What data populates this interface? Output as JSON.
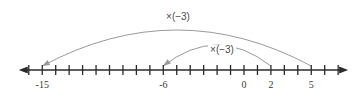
{
  "figure": {
    "background_color": "#ffffff",
    "axis_color": "#2b2b2b",
    "arc_color": "#9a9a9a",
    "label_color": "#3a3a3a"
  },
  "number_line": {
    "min": -16,
    "max": 7,
    "origin_x": 244,
    "unit_px": 13.45,
    "baseline_y": 70,
    "tick_half_height": 5,
    "left_arrow": true,
    "right_arrow": true,
    "tick_values": [
      -16,
      -15,
      -14,
      -13,
      -12,
      -11,
      -10,
      -9,
      -8,
      -7,
      -6,
      -5,
      -4,
      -3,
      -2,
      -1,
      0,
      1,
      2,
      3,
      4,
      5,
      6,
      7
    ],
    "labeled_ticks": [
      {
        "value": -15,
        "label": "-15"
      },
      {
        "value": -6,
        "label": "-6"
      },
      {
        "value": 0,
        "label": "0"
      },
      {
        "value": 2,
        "label": "2"
      },
      {
        "value": 5,
        "label": "5"
      }
    ]
  },
  "arcs": [
    {
      "name": "outer-arc",
      "label": "×(−3)",
      "from_value": 5,
      "to_value": -15,
      "apex_y": 30,
      "label_x": 178,
      "label_y": 12
    },
    {
      "name": "inner-arc",
      "label": "×(−3)",
      "from_value": 2,
      "to_value": -6,
      "apex_y": 45,
      "label_x": 222,
      "label_y": 45
    }
  ]
}
